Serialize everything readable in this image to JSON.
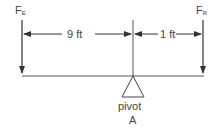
{
  "diagram": {
    "type": "lever",
    "forces": [
      {
        "id": "effort",
        "symbol": "F",
        "subscript": "E",
        "direction": "down"
      },
      {
        "id": "resistance",
        "symbol": "F",
        "subscript": "R",
        "direction": "down"
      }
    ],
    "dimensions": [
      {
        "id": "effort-arm",
        "label": "9 ft"
      },
      {
        "id": "resistance-arm",
        "label": "1 ft"
      }
    ],
    "pivot": {
      "label": "pivot",
      "point": "A"
    },
    "colors": {
      "line": "#333333",
      "text": "#444444",
      "background": "#ffffff"
    }
  }
}
